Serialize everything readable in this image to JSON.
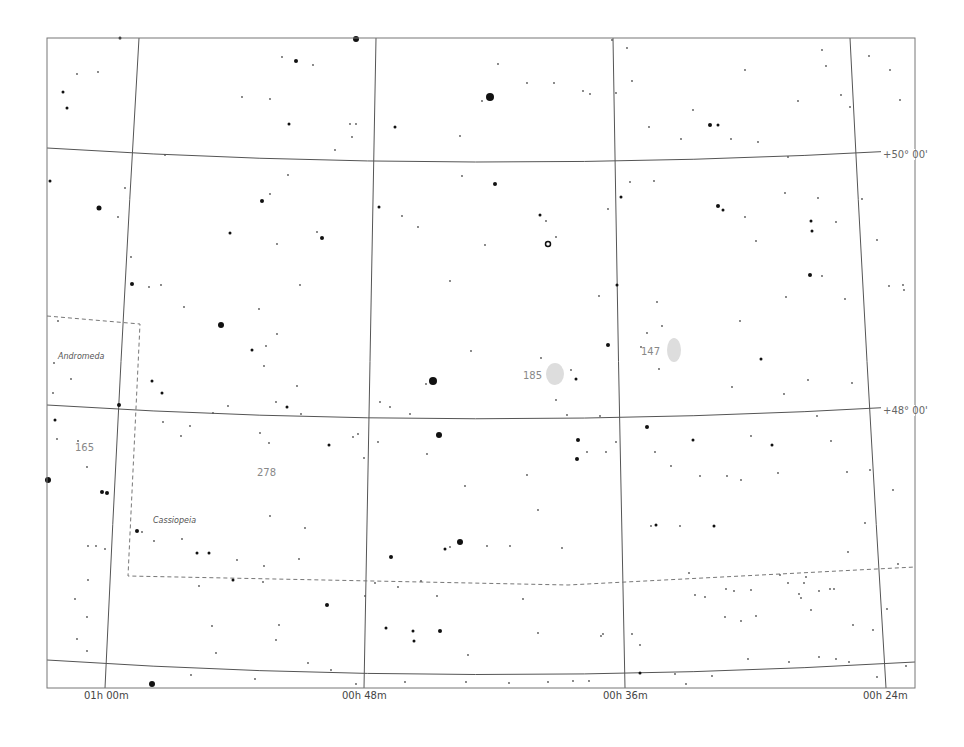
{
  "chart": {
    "frame": {
      "x": 47,
      "y": 38,
      "width": 868,
      "height": 650,
      "stroke": "#777777"
    },
    "ra_labels": [
      {
        "text": "01h 00m",
        "x": 84,
        "y": 699
      },
      {
        "text": "00h 48m",
        "x": 342,
        "y": 699
      },
      {
        "text": "00h 36m",
        "x": 603,
        "y": 699
      },
      {
        "text": "00h 24m",
        "x": 863,
        "y": 699
      }
    ],
    "dec_labels": [
      {
        "text": "+50° 00'",
        "x": 883,
        "y": 158
      },
      {
        "text": "+48° 00'",
        "x": 883,
        "y": 414
      }
    ],
    "constellation_labels": [
      {
        "text": "Andromeda",
        "x": 58,
        "y": 359
      },
      {
        "text": "Cassiopeia",
        "x": 153,
        "y": 523
      }
    ],
    "object_labels": [
      {
        "text": "185",
        "x": 523,
        "y": 379
      },
      {
        "text": "147",
        "x": 641,
        "y": 355
      },
      {
        "text": "165",
        "x": 75,
        "y": 451
      },
      {
        "text": "278",
        "x": 257,
        "y": 476
      }
    ],
    "galaxies": [
      {
        "name": "NGC 185",
        "cx": 555,
        "cy": 374,
        "rx": 9,
        "ry": 11
      },
      {
        "name": "NGC 147",
        "cx": 674,
        "cy": 350,
        "rx": 7,
        "ry": 12
      }
    ],
    "colors": {
      "grid": "#555555",
      "boundary": "#777777",
      "star": "#111111",
      "galaxy": "#dddddd",
      "background": "#ffffff"
    }
  },
  "stars": [
    [
      120,
      38,
      1.5
    ],
    [
      356,
      39,
      3
    ],
    [
      63,
      92,
      1.5
    ],
    [
      67,
      108,
      1.5
    ],
    [
      77,
      74,
      1
    ],
    [
      98,
      72,
      1
    ],
    [
      296,
      61,
      2
    ],
    [
      270,
      99,
      1
    ],
    [
      282,
      57,
      1
    ],
    [
      313,
      65,
      1
    ],
    [
      242,
      97,
      1
    ],
    [
      289,
      124,
      1.5
    ],
    [
      350,
      124,
      1
    ],
    [
      356,
      124,
      1
    ],
    [
      395,
      127,
      1.5
    ],
    [
      460,
      136,
      1
    ],
    [
      490,
      97,
      4
    ],
    [
      482,
      101,
      1
    ],
    [
      498,
      64,
      1
    ],
    [
      527,
      83,
      1
    ],
    [
      554,
      83,
      1
    ],
    [
      583,
      91,
      1
    ],
    [
      590,
      94,
      1
    ],
    [
      616,
      93,
      1
    ],
    [
      632,
      81,
      1
    ],
    [
      710,
      125,
      2
    ],
    [
      718,
      125,
      1.5
    ],
    [
      745,
      70,
      1
    ],
    [
      693,
      110,
      1
    ],
    [
      627,
      48,
      1
    ],
    [
      649,
      127,
      1
    ],
    [
      731,
      139,
      1
    ],
    [
      788,
      157,
      1
    ],
    [
      681,
      139,
      1
    ],
    [
      758,
      142,
      1
    ],
    [
      826,
      66,
      1
    ],
    [
      798,
      101,
      1
    ],
    [
      850,
      107,
      1
    ],
    [
      822,
      50,
      1
    ],
    [
      841,
      95,
      1
    ],
    [
      612,
      40,
      1
    ],
    [
      869,
      56,
      1
    ],
    [
      890,
      70,
      1
    ],
    [
      900,
      100,
      1
    ],
    [
      50,
      181,
      1.5
    ],
    [
      99,
      208,
      2.5
    ],
    [
      118,
      217,
      1
    ],
    [
      125,
      188,
      1
    ],
    [
      165,
      155,
      1
    ],
    [
      230,
      233,
      1.5
    ],
    [
      262,
      201,
      2
    ],
    [
      270,
      194,
      1
    ],
    [
      317,
      232,
      1
    ],
    [
      335,
      150,
      1
    ],
    [
      352,
      137,
      1
    ],
    [
      379,
      207,
      1.5
    ],
    [
      402,
      216,
      1
    ],
    [
      418,
      227,
      1
    ],
    [
      322,
      238,
      2
    ],
    [
      288,
      175,
      1
    ],
    [
      495,
      184,
      2
    ],
    [
      462,
      176,
      1
    ],
    [
      485,
      245,
      1
    ],
    [
      540,
      215,
      1.5
    ],
    [
      546,
      221,
      1
    ],
    [
      548,
      244,
      2.5
    ],
    [
      556,
      237,
      1
    ],
    [
      608,
      209,
      1
    ],
    [
      621,
      197,
      1.5
    ],
    [
      630,
      182,
      1
    ],
    [
      654,
      181,
      1
    ],
    [
      718,
      206,
      2
    ],
    [
      723,
      210,
      1.5
    ],
    [
      745,
      217,
      1
    ],
    [
      785,
      193,
      1
    ],
    [
      818,
      198,
      1
    ],
    [
      811,
      221,
      1.5
    ],
    [
      812,
      231,
      1.5
    ],
    [
      810,
      275,
      2
    ],
    [
      836,
      222,
      1
    ],
    [
      822,
      276,
      1
    ],
    [
      756,
      241,
      1
    ],
    [
      786,
      297,
      1
    ],
    [
      845,
      299,
      1
    ],
    [
      903,
      285,
      1
    ],
    [
      877,
      240,
      1
    ],
    [
      862,
      199,
      1
    ],
    [
      131,
      257,
      1
    ],
    [
      149,
      287,
      1
    ],
    [
      161,
      285,
      1
    ],
    [
      132,
      284,
      2
    ],
    [
      184,
      307,
      1
    ],
    [
      221,
      325,
      3
    ],
    [
      252,
      350,
      1.5
    ],
    [
      266,
      346,
      1
    ],
    [
      264,
      366,
      1
    ],
    [
      259,
      309,
      1
    ],
    [
      277,
      334,
      1
    ],
    [
      276,
      402,
      1
    ],
    [
      301,
      414,
      1
    ],
    [
      277,
      244,
      1
    ],
    [
      300,
      285,
      1
    ],
    [
      297,
      386,
      1
    ],
    [
      287,
      407,
      1.5
    ],
    [
      450,
      281,
      1
    ],
    [
      380,
      402,
      1
    ],
    [
      390,
      407,
      1
    ],
    [
      433,
      381,
      4
    ],
    [
      426,
      384,
      1
    ],
    [
      410,
      414,
      1
    ],
    [
      471,
      351,
      1
    ],
    [
      541,
      358,
      1
    ],
    [
      571,
      370,
      1
    ],
    [
      576,
      379,
      1.5
    ],
    [
      556,
      400,
      1
    ],
    [
      600,
      416,
      1
    ],
    [
      567,
      415,
      1
    ],
    [
      599,
      296,
      1
    ],
    [
      608,
      345,
      2
    ],
    [
      617,
      285,
      1.5
    ],
    [
      641,
      347,
      1
    ],
    [
      647,
      333,
      1
    ],
    [
      659,
      369,
      1
    ],
    [
      662,
      326,
      1
    ],
    [
      657,
      302,
      1
    ],
    [
      740,
      321,
      1
    ],
    [
      761,
      359,
      1.5
    ],
    [
      732,
      387,
      1
    ],
    [
      784,
      394,
      1
    ],
    [
      808,
      380,
      1
    ],
    [
      852,
      383,
      1
    ],
    [
      889,
      286,
      1
    ],
    [
      904,
      290,
      1
    ],
    [
      54,
      363,
      1
    ],
    [
      71,
      379,
      1
    ],
    [
      53,
      393,
      1
    ],
    [
      58,
      321,
      1
    ],
    [
      48,
      480,
      3
    ],
    [
      55,
      420,
      1.5
    ],
    [
      57,
      439,
      1
    ],
    [
      78,
      441,
      1
    ],
    [
      87,
      467,
      1
    ],
    [
      102,
      492,
      2
    ],
    [
      107,
      493,
      2
    ],
    [
      119,
      405,
      2
    ],
    [
      152,
      381,
      1.5
    ],
    [
      162,
      393,
      1.5
    ],
    [
      163,
      422,
      1
    ],
    [
      228,
      406,
      1
    ],
    [
      260,
      433,
      1
    ],
    [
      269,
      443,
      1
    ],
    [
      181,
      436,
      1
    ],
    [
      190,
      426,
      1
    ],
    [
      213,
      413,
      1
    ],
    [
      329,
      445,
      1.5
    ],
    [
      358,
      434,
      1
    ],
    [
      439,
      435,
      3
    ],
    [
      378,
      442,
      1
    ],
    [
      427,
      454,
      1
    ],
    [
      364,
      458,
      1
    ],
    [
      353,
      437,
      1
    ],
    [
      578,
      440,
      2
    ],
    [
      577,
      459,
      2
    ],
    [
      587,
      452,
      1
    ],
    [
      606,
      452,
      1
    ],
    [
      616,
      442,
      1
    ],
    [
      647,
      427,
      2
    ],
    [
      655,
      452,
      1
    ],
    [
      671,
      466,
      1
    ],
    [
      693,
      440,
      1.5
    ],
    [
      700,
      476,
      1
    ],
    [
      727,
      476,
      1
    ],
    [
      751,
      436,
      1
    ],
    [
      772,
      445,
      1.5
    ],
    [
      778,
      473,
      1
    ],
    [
      817,
      416,
      1
    ],
    [
      847,
      472,
      1
    ],
    [
      831,
      441,
      1
    ],
    [
      651,
      526,
      1
    ],
    [
      656,
      525,
      1.5
    ],
    [
      680,
      526,
      1
    ],
    [
      714,
      526,
      1.5
    ],
    [
      741,
      480,
      1
    ],
    [
      780,
      575,
      1
    ],
    [
      806,
      577,
      1
    ],
    [
      804,
      583,
      1
    ],
    [
      819,
      591,
      1
    ],
    [
      811,
      610,
      1
    ],
    [
      834,
      589,
      1
    ],
    [
      893,
      490,
      1
    ],
    [
      898,
      564,
      1
    ],
    [
      865,
      523,
      1
    ],
    [
      848,
      552,
      1
    ],
    [
      830,
      589,
      1
    ],
    [
      870,
      470,
      1
    ],
    [
      88,
      546,
      1
    ],
    [
      96,
      546,
      1
    ],
    [
      105,
      549,
      1
    ],
    [
      137,
      531,
      2
    ],
    [
      142,
      532,
      1
    ],
    [
      154,
      541,
      1
    ],
    [
      182,
      539,
      1
    ],
    [
      197,
      553,
      1.5
    ],
    [
      209,
      553,
      1.5
    ],
    [
      237,
      560,
      1
    ],
    [
      264,
      566,
      1
    ],
    [
      270,
      516,
      1
    ],
    [
      305,
      528,
      1
    ],
    [
      299,
      559,
      1
    ],
    [
      445,
      549,
      1.5
    ],
    [
      450,
      547,
      1
    ],
    [
      460,
      542,
      3
    ],
    [
      487,
      546,
      1
    ],
    [
      510,
      546,
      1
    ],
    [
      562,
      548,
      1
    ],
    [
      538,
      510,
      1
    ],
    [
      527,
      475,
      1
    ],
    [
      465,
      486,
      1
    ],
    [
      391,
      557,
      2
    ],
    [
      375,
      583,
      1
    ],
    [
      398,
      587,
      1
    ],
    [
      421,
      581,
      1
    ],
    [
      437,
      596,
      1
    ],
    [
      365,
      596,
      1
    ],
    [
      523,
      599,
      1
    ],
    [
      538,
      633,
      1
    ],
    [
      601,
      636,
      1
    ],
    [
      603,
      634,
      1
    ],
    [
      632,
      634,
      1
    ],
    [
      640,
      645,
      1
    ],
    [
      689,
      573,
      1
    ],
    [
      695,
      595,
      1
    ],
    [
      705,
      597,
      1
    ],
    [
      726,
      589,
      1
    ],
    [
      725,
      617,
      1
    ],
    [
      734,
      591,
      1
    ],
    [
      751,
      590,
      1
    ],
    [
      756,
      616,
      1
    ],
    [
      741,
      621,
      1
    ],
    [
      799,
      594,
      1
    ],
    [
      801,
      598,
      1
    ],
    [
      788,
      583,
      1
    ],
    [
      853,
      625,
      1
    ],
    [
      873,
      630,
      1
    ],
    [
      887,
      609,
      1
    ],
    [
      199,
      586,
      1
    ],
    [
      233,
      580,
      1.5
    ],
    [
      263,
      582,
      1
    ],
    [
      327,
      605,
      2
    ],
    [
      212,
      626,
      1
    ],
    [
      279,
      625,
      1
    ],
    [
      276,
      640,
      1
    ],
    [
      308,
      663,
      1
    ],
    [
      386,
      628,
      1.5
    ],
    [
      413,
      631,
      1.5
    ],
    [
      440,
      631,
      2
    ],
    [
      414,
      641,
      1.5
    ],
    [
      468,
      655,
      1
    ],
    [
      548,
      682,
      1
    ],
    [
      573,
      681,
      1
    ],
    [
      589,
      681,
      1
    ],
    [
      640,
      673,
      1.5
    ],
    [
      675,
      674,
      1
    ],
    [
      686,
      684,
      1
    ],
    [
      712,
      676,
      1
    ],
    [
      748,
      659,
      1
    ],
    [
      789,
      662,
      1
    ],
    [
      819,
      657,
      1
    ],
    [
      836,
      659,
      1
    ],
    [
      849,
      662,
      1
    ],
    [
      877,
      677,
      1
    ],
    [
      906,
      666,
      1
    ],
    [
      152,
      684,
      3
    ],
    [
      191,
      675,
      1
    ],
    [
      216,
      653,
      1
    ],
    [
      255,
      679,
      1
    ],
    [
      331,
      670,
      1
    ],
    [
      356,
      684,
      1
    ],
    [
      405,
      682,
      1
    ],
    [
      466,
      682,
      1
    ],
    [
      509,
      683,
      1
    ],
    [
      87,
      651,
      1
    ],
    [
      77,
      639,
      1
    ],
    [
      87,
      617,
      1
    ],
    [
      75,
      599,
      1
    ],
    [
      88,
      580,
      1
    ]
  ],
  "grid": {
    "ra_lines": [
      {
        "name": "01h 00m",
        "d": "M 139 38 Q 120 360 105 688"
      },
      {
        "name": "00h 48m",
        "d": "M 376 38 Q 370 360 364 688"
      },
      {
        "name": "00h 36m",
        "d": "M 613 38 Q 618 360 625 688"
      },
      {
        "name": "00h 24m",
        "d": "M 850 38 Q 866 360 886 688"
      }
    ],
    "dec_lines": [
      {
        "name": "+50° 00'",
        "d": "M 47 148 Q 470 175 915 150"
      },
      {
        "name": "+48° 00'",
        "d": "M 47 405 Q 470 432 915 406"
      },
      {
        "name": "+46° 00'",
        "d": "M 47 660 Q 470 688 915 662"
      }
    ]
  },
  "boundaries": [
    {
      "name": "andromeda-cassiopeia",
      "d": "M 47 316 L 140 324 L 128 576 L 568 585 L 915 567"
    }
  ]
}
